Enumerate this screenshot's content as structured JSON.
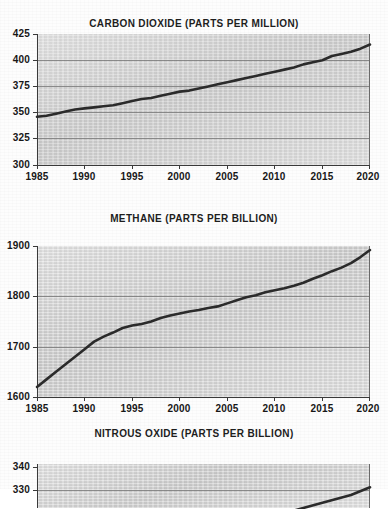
{
  "document": {
    "kind": "scanned-figure",
    "panel_count": 3
  },
  "charts": [
    {
      "id": "co2",
      "title": "CARBON DIOXIDE (PARTS PER MILLION)",
      "ylabels": [
        "425",
        "400",
        "375",
        "350",
        "325",
        "300"
      ],
      "xlabels": [
        "1985",
        "1990",
        "1995",
        "2000",
        "2005",
        "2010",
        "2015",
        "2020"
      ]
    },
    {
      "id": "ch4",
      "title": "METHANE (PARTS PER BILLION)",
      "ylabels": [
        "1900",
        "1800",
        "1700",
        "1600"
      ],
      "xlabels": [
        "1985",
        "1990",
        "1995",
        "2000",
        "2005",
        "2010",
        "2015",
        "2020"
      ]
    },
    {
      "id": "n2o",
      "title": "NITROUS OXIDE (PARTS PER BILLION)",
      "ylabels": [
        "340",
        "330"
      ],
      "xlabels": []
    }
  ],
  "chart_data": [
    {
      "type": "line",
      "title": "CARBON DIOXIDE (PARTS PER MILLION)",
      "xlabel": "",
      "ylabel": "",
      "unit": "parts per million",
      "grid": true,
      "legend": "none",
      "xlim": [
        1985,
        2020
      ],
      "ylim": [
        300,
        425
      ],
      "yticks": [
        300,
        325,
        350,
        375,
        400,
        425
      ],
      "xticks": [
        1985,
        1990,
        1995,
        2000,
        2005,
        2010,
        2015,
        2020
      ],
      "x": [
        1985,
        1986,
        1987,
        1988,
        1989,
        1990,
        1991,
        1992,
        1993,
        1994,
        1995,
        1996,
        1997,
        1998,
        1999,
        2000,
        2001,
        2002,
        2003,
        2004,
        2005,
        2006,
        2007,
        2008,
        2009,
        2010,
        2011,
        2012,
        2013,
        2014,
        2015,
        2016,
        2017,
        2018,
        2019,
        2020
      ],
      "values": [
        346,
        347,
        349,
        351,
        353,
        354,
        355,
        356,
        357,
        359,
        361,
        363,
        364,
        366,
        368,
        370,
        371,
        373,
        375,
        377,
        379,
        381,
        383,
        385,
        387,
        389,
        391,
        393,
        396,
        398,
        400,
        404,
        406,
        408,
        411,
        415
      ]
    },
    {
      "type": "line",
      "title": "METHANE (PARTS PER BILLION)",
      "xlabel": "",
      "ylabel": "",
      "unit": "parts per billion",
      "grid": true,
      "legend": "none",
      "xlim": [
        1985,
        2020
      ],
      "ylim": [
        1600,
        1900
      ],
      "yticks": [
        1600,
        1700,
        1800,
        1900
      ],
      "xticks": [
        1985,
        1990,
        1995,
        2000,
        2005,
        2010,
        2015,
        2020
      ],
      "x": [
        1985,
        1986,
        1987,
        1988,
        1989,
        1990,
        1991,
        1992,
        1993,
        1994,
        1995,
        1996,
        1997,
        1998,
        1999,
        2000,
        2001,
        2002,
        2003,
        2004,
        2005,
        2006,
        2007,
        2008,
        2009,
        2010,
        2011,
        2012,
        2013,
        2014,
        2015,
        2016,
        2017,
        2018,
        2019,
        2020
      ],
      "values": [
        1620,
        1635,
        1650,
        1665,
        1680,
        1695,
        1710,
        1720,
        1728,
        1737,
        1742,
        1745,
        1750,
        1757,
        1762,
        1766,
        1770,
        1773,
        1777,
        1780,
        1786,
        1792,
        1798,
        1802,
        1808,
        1812,
        1816,
        1821,
        1827,
        1835,
        1842,
        1850,
        1857,
        1866,
        1878,
        1892
      ]
    },
    {
      "type": "line",
      "title": "NITROUS OXIDE (PARTS PER BILLION)",
      "xlabel": "",
      "ylabel": "",
      "unit": "parts per billion",
      "grid": true,
      "legend": "none",
      "note": "panel is cropped at the bottom of the image",
      "xlim": [
        1985,
        2020
      ],
      "ylim_visible": [
        326,
        343
      ],
      "yticks_visible": [
        330,
        340
      ],
      "x": [
        1985,
        1990,
        1995,
        2000,
        2005,
        2010,
        2015,
        2018,
        2020
      ],
      "values": [
        305,
        309,
        312,
        316,
        319,
        323,
        328,
        331,
        334
      ]
    }
  ]
}
